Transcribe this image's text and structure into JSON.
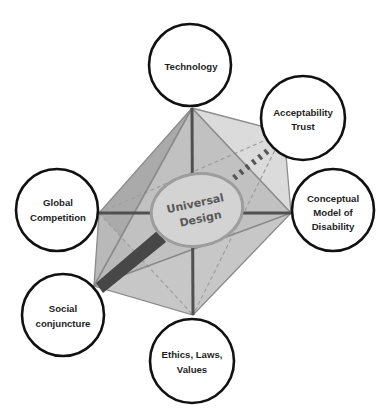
{
  "diagram": {
    "center": {
      "lines": [
        "Universal",
        "Design"
      ]
    },
    "nodes": [
      {
        "id": "technology",
        "lines": [
          "Technology"
        ]
      },
      {
        "id": "acceptability-trust",
        "lines": [
          "Acceptability",
          "Trust"
        ]
      },
      {
        "id": "conceptual-model-of-disability",
        "lines": [
          "Conceptual",
          "Model of",
          "Disability"
        ]
      },
      {
        "id": "global-competition",
        "lines": [
          "Global",
          "Competition"
        ]
      },
      {
        "id": "social-conjuncture",
        "lines": [
          "Social",
          "conjuncture"
        ]
      },
      {
        "id": "ethics-laws-values",
        "lines": [
          "Ethics, Laws,",
          "Values"
        ]
      }
    ]
  },
  "palette": {
    "node_outline": "#111111",
    "node_fill": "#ffffff",
    "face_dark": "#aaaaaa",
    "face_mid": "#c0c0c0",
    "face_light": "#dadada",
    "axis": "#505050",
    "magnifier_handle": "#474747",
    "center_text": "#585858"
  }
}
